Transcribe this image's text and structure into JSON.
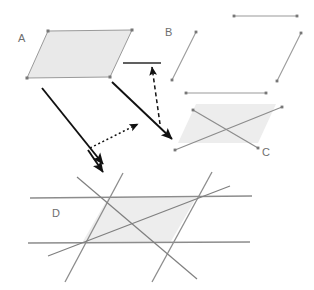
{
  "diagram": {
    "background_color": "#ffffff",
    "width": 314,
    "height": 290,
    "colors": {
      "fill_gray": "#e9e9e9",
      "edge_gray": "#9a9a9a",
      "line_dark": "#3a3a3a",
      "arrow_solid": "#111111",
      "arrow_dashed": "#111111",
      "label_gray": "#6e6e6e",
      "vertex_dot": "#777777"
    },
    "labels": [
      {
        "id": "label-a",
        "text": "A",
        "x": 18,
        "y": 42
      },
      {
        "id": "label-b",
        "text": "B",
        "x": 165,
        "y": 36
      },
      {
        "id": "label-c",
        "text": "C",
        "x": 262,
        "y": 156
      },
      {
        "id": "label-d",
        "text": "D",
        "x": 52,
        "y": 217
      }
    ],
    "shapes": {
      "a": {
        "name": "parallelogram-filled-with-vertices",
        "points": "48,31 132,30 110,77 27,78",
        "filled": true,
        "vertices": [
          {
            "x": 48,
            "y": 31
          },
          {
            "x": 132,
            "y": 30
          },
          {
            "x": 110,
            "y": 77
          },
          {
            "x": 27,
            "y": 78
          }
        ]
      },
      "b": {
        "name": "parallelogram-four-separate-segments",
        "filled": false,
        "segments": [
          {
            "id": "b-top",
            "x1": 234,
            "y1": 16,
            "x2": 297,
            "y2": 16
          },
          {
            "id": "b-left",
            "x1": 196,
            "y1": 32,
            "x2": 172,
            "y2": 80
          },
          {
            "id": "b-right",
            "x1": 301,
            "y1": 33,
            "x2": 277,
            "y2": 81
          },
          {
            "id": "b-bottom",
            "x1": 186,
            "y1": 93,
            "x2": 266,
            "y2": 93
          }
        ]
      },
      "c": {
        "name": "parallelogram-filled-with-two-diagonals",
        "points": "196,104 276,104 258,143 178,143",
        "filled": true,
        "diagonals": [
          {
            "id": "c-diag-1",
            "x1": 193,
            "y1": 110,
            "x2": 258,
            "y2": 148
          },
          {
            "id": "c-diag-2",
            "x1": 175,
            "y1": 150,
            "x2": 282,
            "y2": 107
          }
        ]
      },
      "d": {
        "name": "parallelogram-filled-from-extended-lines-with-diagonals",
        "points": "108,198 196,198 170,243 82,243",
        "filled": true,
        "extended_lines": [
          {
            "id": "d-line-top",
            "x1": 30,
            "y1": 198,
            "x2": 252,
            "y2": 196
          },
          {
            "id": "d-line-bottom",
            "x1": 28,
            "y1": 243,
            "x2": 250,
            "y2": 242
          },
          {
            "id": "d-line-left-slant",
            "x1": 123,
            "y1": 173,
            "x2": 65,
            "y2": 282
          },
          {
            "id": "d-line-right-slant",
            "x1": 212,
            "y1": 172,
            "x2": 152,
            "y2": 282
          }
        ],
        "diagonals": [
          {
            "id": "d-diag-1",
            "x1": 77,
            "y1": 177,
            "x2": 197,
            "y2": 279
          },
          {
            "id": "d-diag-2",
            "x1": 48,
            "y1": 256,
            "x2": 230,
            "y2": 186
          }
        ]
      },
      "stray_segment": {
        "name": "horizontal-segment-near-b",
        "x1": 123,
        "y1": 63,
        "x2": 161,
        "y2": 63
      }
    },
    "arrows": [
      {
        "id": "arrow-a-to-c",
        "style": "solid",
        "from": "A",
        "to": "C",
        "x1": 112,
        "y1": 82,
        "x2": 172,
        "y2": 139
      },
      {
        "id": "arrow-a-to-d",
        "style": "solid",
        "from": "A",
        "to": "D",
        "x1": 42,
        "y1": 88,
        "x2": 103,
        "y2": 164
      },
      {
        "id": "arrow-c-to-segment",
        "style": "dashed",
        "from": "C",
        "to": "horizontal-segment-near-b",
        "x1": 160,
        "y1": 124,
        "x2": 152,
        "y2": 67
      },
      {
        "id": "arrow-d-to-c",
        "style": "dotted",
        "from": "D",
        "to": "C",
        "x1": 90,
        "y1": 148,
        "x2": 138,
        "y2": 124
      },
      {
        "id": "arrow-to-d-top",
        "style": "solid",
        "from": "A",
        "to": "D",
        "x1": 88,
        "y1": 150,
        "x2": 103,
        "y2": 172
      }
    ]
  }
}
